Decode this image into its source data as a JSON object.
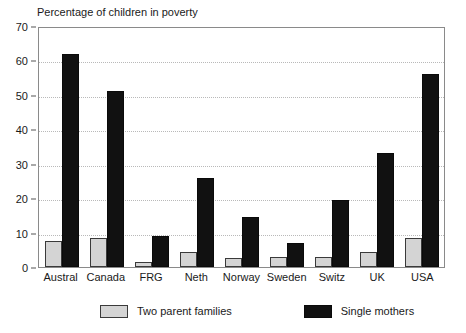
{
  "chart_data": {
    "type": "bar",
    "title": "Percentage of children in poverty",
    "xlabel": "",
    "ylabel": "",
    "ylim": [
      0,
      70
    ],
    "yticks": [
      0,
      10,
      20,
      30,
      40,
      50,
      60,
      70
    ],
    "grid": true,
    "legend_position": "bottom",
    "categories": [
      "Austral",
      "Canada",
      "FRG",
      "Neth",
      "Norway",
      "Sweden",
      "Switz",
      "UK",
      "USA"
    ],
    "series": [
      {
        "name": "Two parent families",
        "color": "#d4d4d4",
        "values": [
          7.7,
          8.5,
          1.5,
          4.5,
          2.5,
          2.8,
          3.0,
          4.5,
          8.3
        ]
      },
      {
        "name": "Single mothers",
        "color": "#111111",
        "values": [
          61.8,
          51.2,
          9.0,
          26.0,
          14.5,
          7.0,
          19.5,
          33.0,
          56.0
        ]
      }
    ]
  }
}
